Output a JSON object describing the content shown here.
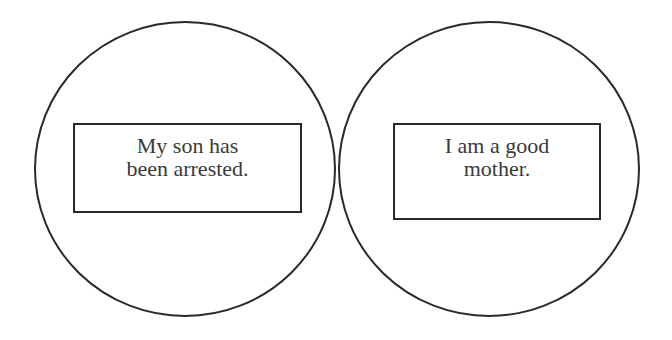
{
  "diagram": {
    "circles": [
      {
        "id": "left",
        "box_lines": [
          "My son has",
          "been arrested."
        ]
      },
      {
        "id": "right",
        "box_lines": [
          "I am a good",
          "mother."
        ]
      }
    ],
    "colors": {
      "stroke": "#2a2a2a",
      "text": "#3a3a3a",
      "background": "#ffffff"
    }
  }
}
